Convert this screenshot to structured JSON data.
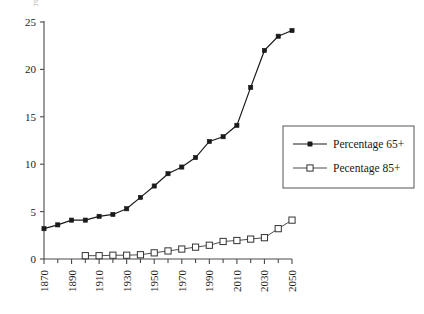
{
  "chart_data": {
    "type": "line",
    "title": "",
    "subtitle": "",
    "xlabel": "",
    "ylabel": "",
    "xlim": [
      1870,
      2050
    ],
    "ylim": [
      0,
      25
    ],
    "x": [
      1870,
      1880,
      1890,
      1900,
      1910,
      1920,
      1930,
      1940,
      1950,
      1960,
      1970,
      1980,
      1990,
      2000,
      2010,
      2020,
      2030,
      2040,
      2050
    ],
    "x_tick_labels": [
      "1870",
      "1890",
      "1910",
      "1930",
      "1950",
      "1970",
      "1990",
      "2010",
      "2030",
      "2050"
    ],
    "x_tick_values": [
      1870,
      1890,
      1910,
      1930,
      1950,
      1970,
      1990,
      2010,
      2030,
      2050
    ],
    "x_minor_tick_values": [
      1880,
      1900,
      1920,
      1940,
      1960,
      1980,
      2000,
      2020,
      2040
    ],
    "y_tick_labels": [
      "0",
      "5",
      "10",
      "15",
      "20",
      "25"
    ],
    "y_tick_values": [
      0,
      5,
      10,
      15,
      20,
      25
    ],
    "grid": false,
    "legend_position": "right-middle",
    "series": [
      {
        "name": "Percentage 65+",
        "marker": "filled-square",
        "color": "#1a1a1a",
        "x": [
          1870,
          1880,
          1890,
          1900,
          1910,
          1920,
          1930,
          1940,
          1950,
          1960,
          1970,
          1980,
          1990,
          2000,
          2010,
          2020,
          2030,
          2040,
          2050
        ],
        "values": [
          3.2,
          3.6,
          4.1,
          4.1,
          4.5,
          4.7,
          5.3,
          6.5,
          7.7,
          9.0,
          9.7,
          10.7,
          12.4,
          12.9,
          14.1,
          18.1,
          22.0,
          23.5,
          24.1
        ]
      },
      {
        "name": "Pecentage 85+",
        "marker": "open-square",
        "color": "#333333",
        "x": [
          1900,
          1910,
          1920,
          1930,
          1940,
          1950,
          1960,
          1970,
          1980,
          1990,
          2000,
          2010,
          2020,
          2030,
          2040,
          2050
        ],
        "values": [
          0.35,
          0.35,
          0.4,
          0.4,
          0.45,
          0.65,
          0.85,
          1.05,
          1.25,
          1.45,
          1.85,
          1.95,
          2.1,
          2.25,
          3.2,
          4.1
        ]
      }
    ]
  },
  "legend": {
    "entries": [
      {
        "label": "Percentage 65+",
        "marker": "filled-square"
      },
      {
        "label": "Pecentage 85+",
        "marker": "open-square"
      }
    ]
  },
  "artifact": {
    "top_clipped_text": "g"
  }
}
